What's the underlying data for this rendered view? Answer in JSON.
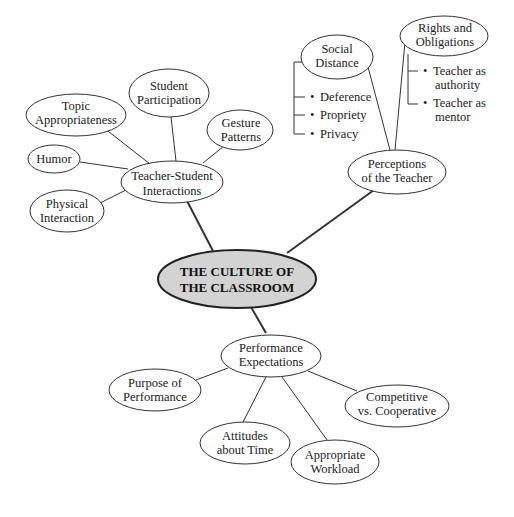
{
  "title": "THE CULTURE OF THE CLASSROOM",
  "center": {
    "line1": "THE CULTURE OF",
    "line2": "THE CLASSROOM",
    "fill": "#d3d3d3"
  },
  "branches": {
    "tsi": {
      "label1": "Teacher-Student",
      "label2": "Interactions",
      "children": {
        "topic": {
          "line1": "Topic",
          "line2": "Appropriateness"
        },
        "student": {
          "line1": "Student",
          "line2": "Participation"
        },
        "gesture": {
          "line1": "Gesture",
          "line2": "Patterns"
        },
        "humor": {
          "line1": "Humor"
        },
        "physical": {
          "line1": "Physical",
          "line2": "Interaction"
        }
      }
    },
    "perceptions": {
      "label1": "Perceptions",
      "label2": "of the Teacher",
      "children": {
        "social": {
          "line1": "Social",
          "line2": "Distance",
          "bullets": [
            "Deference",
            "Propriety",
            "Privacy"
          ]
        },
        "rights": {
          "line1": "Rights and",
          "line2": "Obligations",
          "bullets": [
            {
              "a": "Teacher as",
              "b": "authority"
            },
            {
              "a": "Teacher as",
              "b": "mentor"
            }
          ]
        }
      }
    },
    "performance": {
      "label1": "Performance",
      "label2": "Expectations",
      "children": {
        "purpose": {
          "line1": "Purpose of",
          "line2": "Performance"
        },
        "attitudes": {
          "line1": "Attitudes",
          "line2": "about Time"
        },
        "workload": {
          "line1": "Appropriate",
          "line2": "Workload"
        },
        "competitive": {
          "line1": "Competitive",
          "line2": "vs. Cooperative"
        }
      }
    }
  }
}
